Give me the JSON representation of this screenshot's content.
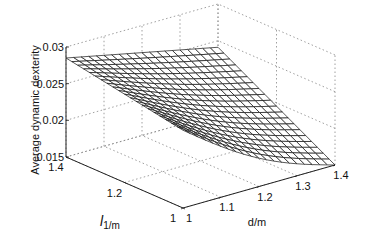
{
  "chart_data": {
    "type": "surface",
    "title": "",
    "xlabel": "d/m",
    "ylabel_main": "l",
    "ylabel_sub": "1/m",
    "zlabel": "Average dynamic dexterity",
    "x_ticks": [
      "1",
      "1.1",
      "1.2",
      "1.3",
      "1.4"
    ],
    "y_ticks": [
      "1",
      "1.2",
      "1.4"
    ],
    "z_ticks": [
      "0.015",
      "0.02",
      "0.025",
      "0.03"
    ],
    "xlim": [
      1,
      1.4
    ],
    "ylim": [
      1,
      1.4
    ],
    "zlim": [
      0.015,
      0.03
    ],
    "grid": true,
    "corners": {
      "d1_l1": 0.0256,
      "d14_l1": 0.015,
      "d1_l14": 0.0285,
      "d14_l14": 0.0241
    },
    "mesh_resolution": 21
  },
  "colors": {
    "mesh": "#111111",
    "face": "#ffffff",
    "grid": "#888888",
    "axis": "#222222"
  }
}
